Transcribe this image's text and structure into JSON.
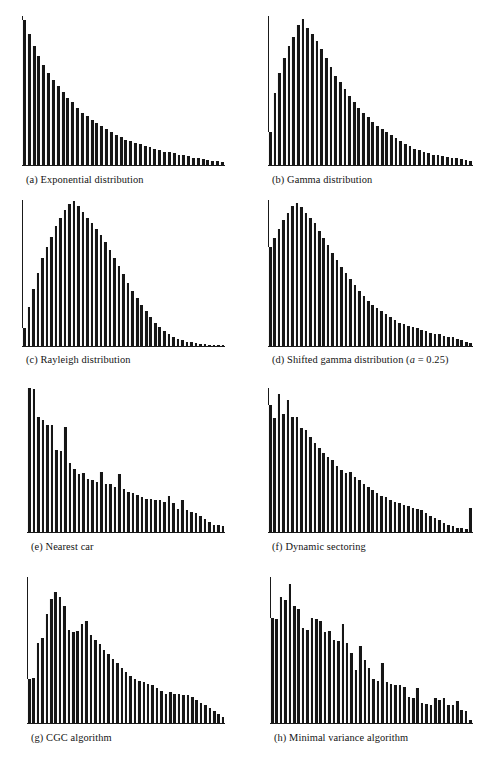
{
  "figure": {
    "type": "multi-panel-histogram-figure",
    "panel_count": 8,
    "layout": "4 rows x 2 columns",
    "background_color": "#ffffff",
    "bar_color": "#161616",
    "axis_color": "#1a1a1a"
  },
  "panels": [
    {
      "key": "a",
      "caption": "(a) Exponential distribution",
      "caption_label": "(a)",
      "caption_text": "Exponential distribution"
    },
    {
      "key": "b",
      "caption": "(b) Gamma distribution",
      "caption_label": "(b)",
      "caption_text": "Gamma distribution"
    },
    {
      "key": "c",
      "caption": "(c) Rayleigh distribution",
      "caption_label": "(c)",
      "caption_text": "Rayleigh distribution"
    },
    {
      "key": "d",
      "caption": "(d) Shifted gamma distribution (a = 0.25)",
      "caption_label": "(d)",
      "caption_text": "Shifted gamma distribution",
      "caption_param_italic": "a",
      "caption_param_rest": " = 0.25"
    },
    {
      "key": "e",
      "caption": "(e) Nearest car",
      "caption_label": "(e)",
      "caption_text": "Nearest car"
    },
    {
      "key": "f",
      "caption": "(f) Dynamic sectoring",
      "caption_label": "(f)",
      "caption_text": "Dynamic sectoring"
    },
    {
      "key": "g",
      "caption": "(g) CGC algorithm",
      "caption_label": "(g)",
      "caption_text": "CGC algorithm"
    },
    {
      "key": "h",
      "caption": "(h) Minimal variance algorithm",
      "caption_label": "(h)",
      "caption_text": "Minimal variance algorithm"
    }
  ],
  "chart_data": [
    {
      "type": "bar",
      "panel": "a",
      "title": "(a) Exponential distribution",
      "xlabel": "",
      "ylabel": "",
      "grid": false,
      "legend": "none",
      "axes": "left spine and bottom baseline only, no tick labels",
      "ylim": [
        0,
        100
      ],
      "categories": [
        "1",
        "2",
        "3",
        "4",
        "5",
        "6",
        "7",
        "8",
        "9",
        "10",
        "11",
        "12",
        "13",
        "14",
        "15",
        "16",
        "17",
        "18",
        "19",
        "20",
        "21",
        "22",
        "23",
        "24",
        "25",
        "26",
        "27",
        "28",
        "29",
        "30",
        "31",
        "32",
        "33",
        "34",
        "35",
        "36",
        "37",
        "38",
        "39",
        "40",
        "41",
        "42"
      ],
      "values": [
        97,
        88,
        80,
        73,
        67,
        62,
        57,
        53,
        49,
        45,
        42,
        38,
        35,
        33,
        30,
        28,
        26,
        24,
        22,
        20,
        19,
        17,
        16,
        15,
        14,
        13,
        12,
        11,
        10,
        9,
        8.5,
        8,
        7,
        6.5,
        6,
        5,
        4.5,
        4,
        3.5,
        3,
        2.5,
        2
      ]
    },
    {
      "type": "bar",
      "panel": "b",
      "title": "(b) Gamma distribution",
      "xlabel": "",
      "ylabel": "",
      "grid": false,
      "legend": "none",
      "axes": "left spine and bottom baseline only, no tick labels",
      "ylim": [
        0,
        100
      ],
      "categories": [
        "1",
        "2",
        "3",
        "4",
        "5",
        "6",
        "7",
        "8",
        "9",
        "10",
        "11",
        "12",
        "13",
        "14",
        "15",
        "16",
        "17",
        "18",
        "19",
        "20",
        "21",
        "22",
        "23",
        "24",
        "25",
        "26",
        "27",
        "28",
        "29",
        "30",
        "31",
        "32",
        "33",
        "34",
        "35",
        "36",
        "37",
        "38",
        "39",
        "40",
        "41",
        "42",
        "43",
        "44"
      ],
      "values": [
        22,
        48,
        62,
        72,
        80,
        86,
        94,
        98,
        92,
        88,
        83,
        78,
        72,
        66,
        60,
        56,
        51,
        46,
        42,
        38,
        35,
        32,
        29,
        26,
        24,
        22,
        20,
        18,
        16,
        14,
        12.5,
        11,
        10,
        9,
        8,
        7,
        6.5,
        6,
        5.5,
        5,
        4.5,
        4,
        3.5,
        3
      ]
    },
    {
      "type": "bar",
      "panel": "c",
      "title": "(c) Rayleigh distribution",
      "xlabel": "",
      "ylabel": "",
      "grid": false,
      "legend": "none",
      "axes": "left spine and bottom baseline only, no tick labels",
      "ylim": [
        0,
        100
      ],
      "categories": [
        "1",
        "2",
        "3",
        "4",
        "5",
        "6",
        "7",
        "8",
        "9",
        "10",
        "11",
        "12",
        "13",
        "14",
        "15",
        "16",
        "17",
        "18",
        "19",
        "20",
        "21",
        "22",
        "23",
        "24",
        "25",
        "26",
        "27",
        "28",
        "29",
        "30",
        "31",
        "32",
        "33",
        "34",
        "35",
        "36",
        "37",
        "38",
        "39",
        "40",
        "41",
        "42",
        "43",
        "44",
        "45"
      ],
      "values": [
        12,
        27,
        39,
        50,
        60,
        68,
        75,
        82,
        88,
        93,
        97,
        99,
        96,
        92,
        88,
        84,
        80,
        76,
        71,
        66,
        60,
        55,
        49,
        43,
        38,
        33,
        28,
        24,
        20,
        16,
        13,
        10,
        8,
        6.5,
        5,
        4,
        3,
        2.5,
        2,
        1.6,
        1.2,
        1,
        0.8,
        0.6,
        0.5
      ]
    },
    {
      "type": "bar",
      "panel": "d",
      "title": "(d) Shifted gamma distribution (a = 0.25)",
      "xlabel": "",
      "ylabel": "",
      "grid": false,
      "legend": "none",
      "axes": "left spine and bottom baseline only, no tick labels",
      "ylim": [
        0,
        100
      ],
      "categories": [
        "1",
        "2",
        "3",
        "4",
        "5",
        "6",
        "7",
        "8",
        "9",
        "10",
        "11",
        "12",
        "13",
        "14",
        "15",
        "16",
        "17",
        "18",
        "19",
        "20",
        "21",
        "22",
        "23",
        "24",
        "25",
        "26",
        "27",
        "28",
        "29",
        "30",
        "31",
        "32",
        "33",
        "34",
        "35",
        "36",
        "37",
        "38",
        "39",
        "40",
        "41",
        "42",
        "43",
        "44",
        "45",
        "46"
      ],
      "values": [
        68,
        74,
        80,
        86,
        91,
        96,
        98,
        95,
        91,
        88,
        84,
        79,
        74,
        69,
        64,
        59,
        54,
        50,
        46,
        42,
        38,
        34,
        31,
        28,
        26,
        24,
        22,
        20,
        18,
        16,
        15,
        14,
        13,
        12,
        11,
        10,
        9,
        8.5,
        8,
        7,
        6.5,
        6,
        5,
        4,
        3,
        1.8
      ]
    },
    {
      "type": "bar",
      "panel": "e",
      "title": "(e) Nearest car",
      "xlabel": "",
      "ylabel": "",
      "grid": false,
      "legend": "none",
      "axes": "left spine and bottom baseline only, no tick labels",
      "ylim": [
        0,
        100
      ],
      "categories": [
        "1",
        "2",
        "3",
        "4",
        "5",
        "6",
        "7",
        "8",
        "9",
        "10",
        "11",
        "12",
        "13",
        "14",
        "15",
        "16",
        "17",
        "18",
        "19",
        "20",
        "21",
        "22",
        "23",
        "24",
        "25",
        "26",
        "27",
        "28",
        "29",
        "30",
        "31",
        "32",
        "33",
        "34",
        "35",
        "36",
        "37",
        "38",
        "39",
        "40",
        "41",
        "42",
        "43",
        "44"
      ],
      "values": [
        100,
        99,
        80,
        78,
        74,
        74,
        57,
        56,
        73,
        48,
        44,
        40,
        41,
        37,
        36,
        35,
        42,
        33,
        33,
        31,
        40,
        30,
        28,
        27,
        26,
        24,
        23,
        23,
        22,
        22,
        21,
        25,
        20,
        16,
        22,
        15,
        14,
        13,
        11,
        9,
        7,
        5,
        5,
        4
      ]
    },
    {
      "type": "bar",
      "panel": "f",
      "title": "(f) Dynamic sectoring",
      "xlabel": "",
      "ylabel": "",
      "grid": false,
      "legend": "none",
      "axes": "left spine and bottom baseline only, no tick labels, last bin is an overflow spike",
      "ylim": [
        0,
        100
      ],
      "categories": [
        "1",
        "2",
        "3",
        "4",
        "5",
        "6",
        "7",
        "8",
        "9",
        "10",
        "11",
        "12",
        "13",
        "14",
        "15",
        "16",
        "17",
        "18",
        "19",
        "20",
        "21",
        "22",
        "23",
        "24",
        "25",
        "26",
        "27",
        "28",
        "29",
        "30",
        "31",
        "32",
        "33",
        "34",
        "35",
        "36",
        "37",
        "38",
        "39",
        "40",
        "41",
        "42",
        "43",
        "44",
        "45",
        "46"
      ],
      "values": [
        88,
        79,
        96,
        82,
        92,
        80,
        80,
        72,
        71,
        66,
        62,
        58,
        55,
        52,
        50,
        46,
        43,
        41,
        42,
        38,
        36,
        33,
        31,
        29,
        27,
        25,
        24,
        22,
        21,
        20,
        19,
        18,
        17,
        16,
        15,
        13,
        11,
        10,
        8,
        6,
        5,
        4,
        3,
        2.5,
        2,
        17
      ]
    },
    {
      "type": "bar",
      "panel": "g",
      "title": "(g) CGC algorithm",
      "xlabel": "",
      "ylabel": "",
      "grid": false,
      "legend": "none",
      "axes": "left spine and bottom baseline only, no tick labels",
      "ylim": [
        0,
        100
      ],
      "categories": [
        "1",
        "2",
        "3",
        "4",
        "5",
        "6",
        "7",
        "8",
        "9",
        "10",
        "11",
        "12",
        "13",
        "14",
        "15",
        "16",
        "17",
        "18",
        "19",
        "20",
        "21",
        "22",
        "23",
        "24",
        "25",
        "26",
        "27",
        "28",
        "29",
        "30",
        "31",
        "32",
        "33",
        "34",
        "35",
        "36",
        "37",
        "38",
        "39",
        "40",
        "41",
        "42",
        "43",
        "44",
        "45"
      ],
      "values": [
        30,
        31,
        55,
        58,
        75,
        85,
        90,
        86,
        80,
        64,
        62,
        63,
        68,
        70,
        60,
        57,
        54,
        50,
        47,
        44,
        41,
        38,
        35,
        32,
        30,
        29,
        28,
        27,
        26,
        24,
        22,
        20,
        21,
        20,
        20,
        19,
        19,
        18,
        16,
        14,
        12,
        10,
        8,
        6,
        4
      ]
    },
    {
      "type": "bar",
      "panel": "h",
      "title": "(h) Minimal variance algorithm",
      "xlabel": "",
      "ylabel": "",
      "grid": false,
      "legend": "none",
      "axes": "left spine and bottom baseline only, no tick labels",
      "ylim": [
        0,
        100
      ],
      "categories": [
        "1",
        "2",
        "3",
        "4",
        "5",
        "6",
        "7",
        "8",
        "9",
        "10",
        "11",
        "12",
        "13",
        "14",
        "15",
        "16",
        "17",
        "18",
        "19",
        "20",
        "21",
        "22",
        "23",
        "24",
        "25",
        "26",
        "27",
        "28",
        "29",
        "30",
        "31",
        "32",
        "33",
        "34",
        "35",
        "36",
        "37",
        "38",
        "39",
        "40",
        "41",
        "42",
        "43",
        "44",
        "45",
        "46"
      ],
      "values": [
        72,
        71,
        86,
        84,
        95,
        80,
        78,
        65,
        64,
        72,
        71,
        70,
        62,
        63,
        57,
        56,
        68,
        55,
        48,
        36,
        53,
        43,
        38,
        30,
        29,
        41,
        28,
        27,
        26,
        26,
        25,
        18,
        17,
        24,
        14,
        13,
        12,
        17,
        16,
        17,
        12,
        12,
        15,
        9,
        8,
        2
      ]
    }
  ]
}
